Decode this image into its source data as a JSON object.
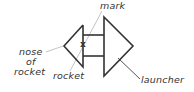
{
  "diagram": {
    "labels": {
      "mark": "mark",
      "nose_line1": "nose",
      "nose_line2": "of",
      "nose_line3": "rocket",
      "rocket": "rocket",
      "launcher": "launcher",
      "x_mark": "x"
    },
    "colors": {
      "stroke": "#333333",
      "leader": "#bbbbbb",
      "text": "#333333"
    }
  }
}
